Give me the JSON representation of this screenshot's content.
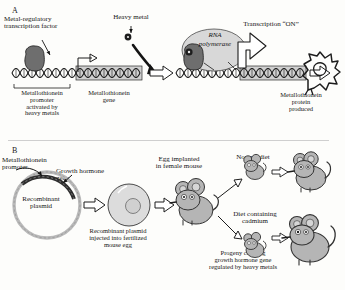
{
  "figure": {
    "panels": [
      {
        "letter": "A",
        "title": "Metal-regulated transcription of the metallothionein gene",
        "labels": {
          "transcription_factor": "Metal-regulatory\ntranscription factor",
          "heavy_metal": "Heavy metal",
          "rna_polymerase_line1": "RNA",
          "rna_polymerase_line2": "polymerase",
          "transcription_on": "Transcription “ON”",
          "promoter": "Metallothionein\npromoter\nactivated by\nheavy metals",
          "gene": "Metallothionein\ngene",
          "protein": "Metallothionein\nprotein\nproduced"
        }
      },
      {
        "letter": "B",
        "title": "Production of transgenic mice carrying a metal-regulated growth hormone gene",
        "labels": {
          "mt_promoter": "Metallothionein\npromoter",
          "gh_gene": "Growth hormone\ngene",
          "recombinant_plasmid": "Recombinant\nplasmid",
          "injection": "Recombinant plasmid\ninjected into fertilized\nmouse egg",
          "egg_implanted": "Egg implanted\nin female mouse",
          "normal_diet": "Normal diet",
          "cadmium_diet": "Diet containing\ncadmium",
          "progeny": "Progeny carrying\ngrowth hormone gene\nregulated by heavy metals"
        }
      }
    ],
    "colors": {
      "ink": "#141414",
      "dna_dark": "#2b2b2b",
      "protein_fill": "#6e6e6e",
      "polymerase_fill": "#d8d8d8",
      "plasmid_light": "#b9b9b9",
      "plasmid_dark": "#2e2e2e",
      "egg_fill": "#dcdcdc",
      "mouse_fill": "#b5b5b5",
      "gene_box_fill": "#cfcfcf",
      "background": "#fdfdfb"
    }
  }
}
